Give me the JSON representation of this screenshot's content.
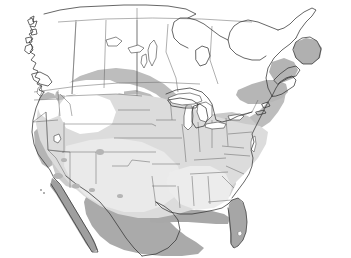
{
  "figure": {
    "name": "north-america-distribution-map",
    "type": "map",
    "title": "",
    "caption": "",
    "width": 351,
    "height": 258,
    "background": "#ffffff",
    "projection_hint": "conic",
    "has_frame": false,
    "has_legend": false,
    "has_labels": false,
    "has_scalebar": false
  },
  "palette": {
    "background": "#ffffff",
    "outline": "#3a3a3a",
    "internal_border": "#5a5a5a",
    "graticule": "#6a6a6a",
    "water": "#ffffff",
    "shade_none": "#ffffff",
    "shade_very_light": "#e9e9e9",
    "shade_light": "#dcdcdc",
    "shade_medium_light": "#cfcfcf",
    "shade_medium": "#bdbdbd",
    "shade_medium_dark": "#aaaaaa",
    "shade_dark": "#9a9a9a"
  },
  "shading_classes": [
    {
      "id": "class-0",
      "label": "absent",
      "color": "#ffffff"
    },
    {
      "id": "class-1",
      "label": "very-low",
      "color": "#e9e9e9"
    },
    {
      "id": "class-2",
      "label": "low",
      "color": "#dcdcdc"
    },
    {
      "id": "class-3",
      "label": "moderate",
      "color": "#cfcfcf"
    },
    {
      "id": "class-4",
      "label": "high",
      "color": "#bdbdbd"
    },
    {
      "id": "class-5",
      "label": "very-high",
      "color": "#aaaaaa"
    }
  ],
  "regions": [
    {
      "id": "canada",
      "name": "canada-landmass",
      "shading": "class-0"
    },
    {
      "id": "united-states",
      "name": "united-states-landmass",
      "shading": "class-2"
    },
    {
      "id": "mexico",
      "name": "mexico-landmass",
      "shading": "class-4"
    },
    {
      "id": "baja-california",
      "name": "baja-california-peninsula",
      "shading": "class-4"
    },
    {
      "id": "florida",
      "name": "florida-peninsula",
      "shading": "class-4"
    },
    {
      "id": "newfoundland",
      "name": "newfoundland-island",
      "shading": "class-3"
    },
    {
      "id": "vancouver-island",
      "name": "vancouver-island",
      "shading": "class-0"
    }
  ],
  "water_bodies": [
    {
      "id": "lake-superior",
      "name": "lake-superior"
    },
    {
      "id": "lake-michigan",
      "name": "lake-michigan"
    },
    {
      "id": "lake-huron",
      "name": "lake-huron"
    },
    {
      "id": "lake-erie",
      "name": "lake-erie"
    },
    {
      "id": "lake-ontario",
      "name": "lake-ontario"
    },
    {
      "id": "lake-winnipeg",
      "name": "lake-winnipeg"
    },
    {
      "id": "lake-athabasca",
      "name": "lake-athabasca"
    },
    {
      "id": "great-slave-lake",
      "name": "great-slave-lake"
    },
    {
      "id": "great-salt-lake",
      "name": "great-salt-lake"
    },
    {
      "id": "lake-okeechobee",
      "name": "lake-okeechobee"
    },
    {
      "id": "gulf-of-mexico",
      "name": "gulf-of-mexico"
    },
    {
      "id": "gulf-of-st-lawrence",
      "name": "gulf-of-st-lawrence"
    },
    {
      "id": "hudson-bay-approach",
      "name": "hudson-bay-approach"
    },
    {
      "id": "puget-sound",
      "name": "puget-sound"
    },
    {
      "id": "chesapeake-bay",
      "name": "chesapeake-bay"
    }
  ],
  "graticule": [
    {
      "id": "parallel-49",
      "name": "parallel-49n",
      "orientation": "horizontal"
    },
    {
      "id": "parallel-60",
      "name": "parallel-60n",
      "orientation": "horizontal"
    },
    {
      "id": "meridian-110",
      "name": "meridian-110w",
      "orientation": "vertical"
    }
  ]
}
